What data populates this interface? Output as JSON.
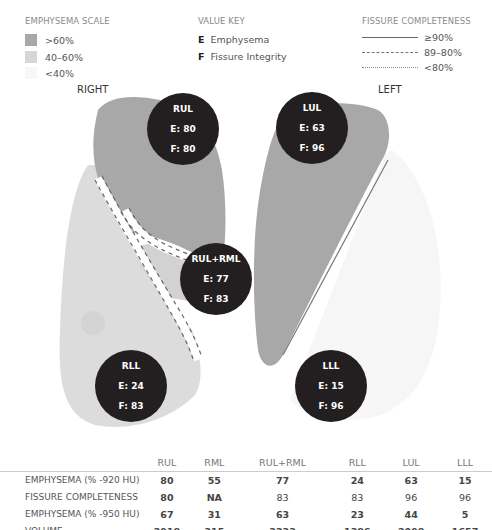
{
  "legend": {
    "emphysema_scale": {
      "title": "EMPHYSEMA SCALE",
      "items": [
        {
          "label": ">60%",
          "color": "#a8a8a8"
        },
        {
          "label": "40–60%",
          "color": "#d6d6d6"
        },
        {
          "label": "<40%",
          "color": "#f7f7f7"
        }
      ]
    },
    "value_key": {
      "title": "VALUE KEY",
      "items": [
        {
          "letter": "E",
          "label": "Emphysema"
        },
        {
          "letter": "F",
          "label": "Fissure Integrity"
        }
      ]
    },
    "fissure_completeness": {
      "title": "FISSURE COMPLETENESS",
      "items": [
        {
          "style": "solid",
          "label": "≥90%"
        },
        {
          "style": "dashed",
          "label": "89–80%"
        },
        {
          "style": "dotted",
          "label": "<80%"
        }
      ]
    }
  },
  "sides": {
    "right": "RIGHT",
    "left": "LEFT"
  },
  "lobes": [
    {
      "name": "RUL",
      "e": "E: 80",
      "f": "F: 80"
    },
    {
      "name": "LUL",
      "e": "E: 63",
      "f": "F: 96"
    },
    {
      "name": "RUL+RML",
      "e": "E: 77",
      "f": "F: 83"
    },
    {
      "name": "RLL",
      "e": "E: 24",
      "f": "F: 83"
    },
    {
      "name": "LLL",
      "e": "E: 15",
      "f": "F: 96"
    }
  ],
  "table": {
    "columns": [
      "RUL",
      "RML",
      "RUL+RML",
      "RLL",
      "LUL",
      "LLL"
    ],
    "rows": [
      {
        "label": "EMPHYSEMA (% -920 HU)",
        "values": [
          "80",
          "55",
          "77",
          "24",
          "63",
          "15"
        ]
      },
      {
        "label": "FISSURE COMPLETENESS",
        "values": [
          "80",
          "NA",
          "83",
          "83",
          "96",
          "96"
        ]
      },
      {
        "label": "EMPHYSEMA (% -950 HU)",
        "values": [
          "67",
          "31",
          "63",
          "23",
          "44",
          "5"
        ]
      },
      {
        "label": "VOLUME",
        "values": [
          "2918",
          "315",
          "3233",
          "1386",
          "2098",
          "1657"
        ]
      }
    ]
  },
  "colors": {
    "high": "#a8a8a8",
    "mid": "#d6d6d6",
    "low": "#f7f7f7",
    "bubble": "#231f20"
  }
}
